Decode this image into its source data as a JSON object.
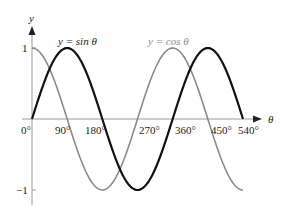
{
  "chart_data": {
    "type": "line",
    "title": "",
    "xlabel": "θ",
    "ylabel": "y",
    "xlim": [
      0,
      540
    ],
    "ylim": [
      -1,
      1
    ],
    "x_ticks": [
      "0°",
      "90°",
      "180°",
      "270°",
      "360°",
      "450°",
      "540°"
    ],
    "y_ticks": [
      "1",
      "−1"
    ],
    "grid": false,
    "legend": "inline annotations",
    "x": [
      0,
      45,
      90,
      135,
      180,
      225,
      270,
      315,
      360,
      405,
      450,
      495,
      540
    ],
    "series": [
      {
        "name": "y = sin θ",
        "color": "#111111",
        "values": [
          0,
          0.707,
          1,
          0.707,
          0,
          -0.707,
          -1,
          -0.707,
          0,
          0.707,
          1,
          0.707,
          0
        ]
      },
      {
        "name": "y = cos θ",
        "color": "#8a8a8a",
        "values": [
          1,
          0.707,
          0,
          -0.707,
          -1,
          -0.707,
          0,
          0.707,
          1,
          0.707,
          0,
          -0.707,
          -1
        ]
      }
    ]
  },
  "labels": {
    "y_axis": "y",
    "x_axis": "θ",
    "sin_label_prefix": "y = sin ",
    "cos_label_prefix": "y = cos ",
    "theta": "θ",
    "y_tick_pos": "1",
    "y_tick_neg": "−1",
    "x_ticks": [
      "0°",
      "90°",
      "180°",
      "270°",
      "360°",
      "450°",
      "540°"
    ]
  }
}
